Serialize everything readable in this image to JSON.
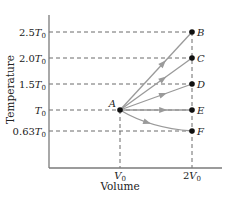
{
  "diagram": {
    "type": "temperature-volume process diagram",
    "x_axis": {
      "label": "Volume",
      "ticks": [
        {
          "base": "V",
          "sub": "0",
          "coef": "",
          "x": 120
        },
        {
          "base": "V",
          "sub": "0",
          "coef": "2",
          "x": 192
        }
      ]
    },
    "y_axis": {
      "label": "Temperature",
      "ticks": [
        {
          "coef": "2.5",
          "base": "T",
          "sub": "0",
          "y": 32
        },
        {
          "coef": "2.0",
          "base": "T",
          "sub": "0",
          "y": 58
        },
        {
          "coef": "1.5",
          "base": "T",
          "sub": "0",
          "y": 84
        },
        {
          "coef": "",
          "base": "T",
          "sub": "0",
          "y": 110
        },
        {
          "coef": "0.63",
          "base": "T",
          "sub": "0",
          "y": 131
        }
      ]
    },
    "start_point": {
      "label": "A",
      "x": 120,
      "y": 110
    },
    "end_points": [
      {
        "label": "B",
        "x": 192,
        "y": 32,
        "value": "2.5T0"
      },
      {
        "label": "C",
        "x": 192,
        "y": 58,
        "value": "2.0T0"
      },
      {
        "label": "D",
        "x": 192,
        "y": 84,
        "value": "1.5T0"
      },
      {
        "label": "E",
        "x": 192,
        "y": 110,
        "value": "T0"
      },
      {
        "label": "F",
        "x": 192,
        "y": 131,
        "value": "0.63T0"
      }
    ],
    "colors": {
      "axis": "#7a7a7a",
      "dashed": "#6a6a6a",
      "process_line": "#9a9a9a",
      "arrow": "#9a9a9a",
      "point": "#111111",
      "text": "#222222"
    }
  }
}
